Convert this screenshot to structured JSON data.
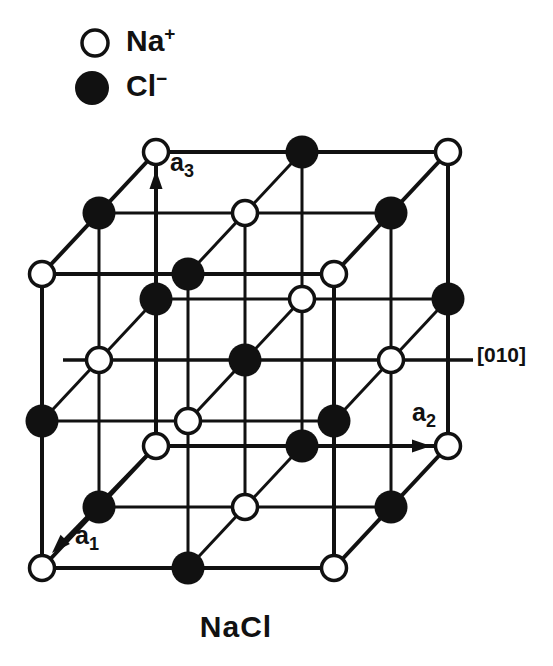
{
  "colors": {
    "ink": "#111111",
    "background": "#ffffff"
  },
  "legend": {
    "items": [
      {
        "ion": "Na+",
        "label": "Na",
        "charge": "+",
        "symbol": "open-circle"
      },
      {
        "ion": "Cl-",
        "label": "Cl",
        "charge": "−",
        "symbol": "filled-circle"
      }
    ]
  },
  "caption": {
    "text": "NaCl"
  },
  "figure": {
    "type": "crystal-structure",
    "structure": "rock-salt NaCl conventional cubic cell, 3×3×3 alternating ion sites",
    "projection": {
      "origin": [
        156,
        446
      ],
      "step_i": [
        146,
        0
      ],
      "step_j": [
        -57,
        61
      ],
      "step_k": [
        0,
        -147
      ],
      "steps": [
        0,
        1,
        2
      ]
    },
    "atom_styles": {
      "Na+": {
        "fill": "#ffffff",
        "stroke_width": 3.5,
        "radius": 12.5
      },
      "Cl-": {
        "fill": "#111111",
        "stroke_width": 0,
        "radius": 16.5
      }
    },
    "legend_symbols": [
      {
        "ion": "Na+",
        "center": [
          95,
          43
        ],
        "radius": 13
      },
      {
        "ion": "Cl-",
        "center": [
          92,
          88
        ],
        "radius": 17
      }
    ],
    "wireframe": {
      "edge_width": 4,
      "inner_width": 3
    },
    "axes": [
      {
        "id": "a1",
        "label": "a",
        "sub": "1",
        "shaft_from": [
          156,
          446
        ],
        "tip": [
          52,
          553
        ]
      },
      {
        "id": "a2",
        "label": "a",
        "sub": "2",
        "shaft_from": [
          156,
          446
        ],
        "tip": [
          431,
          446
        ]
      },
      {
        "id": "a3",
        "label": "a",
        "sub": "3",
        "shaft_from": [
          156,
          446
        ],
        "tip": [
          156,
          170
        ]
      }
    ],
    "direction_label": {
      "text": "[010]",
      "line_from": [
        63,
        360
      ],
      "line_to": [
        473,
        360
      ],
      "line_width": 3.5
    },
    "atoms": [
      {
        "pos": [
          0,
          0,
          0
        ],
        "ion": "Na+"
      },
      {
        "pos": [
          1,
          0,
          0
        ],
        "ion": "Cl-"
      },
      {
        "pos": [
          2,
          0,
          0
        ],
        "ion": "Na+"
      },
      {
        "pos": [
          0,
          1,
          0
        ],
        "ion": "Cl-"
      },
      {
        "pos": [
          1,
          1,
          0
        ],
        "ion": "Na+"
      },
      {
        "pos": [
          2,
          1,
          0
        ],
        "ion": "Cl-"
      },
      {
        "pos": [
          0,
          2,
          0
        ],
        "ion": "Na+"
      },
      {
        "pos": [
          1,
          2,
          0
        ],
        "ion": "Cl-"
      },
      {
        "pos": [
          2,
          2,
          0
        ],
        "ion": "Na+"
      },
      {
        "pos": [
          0,
          0,
          1
        ],
        "ion": "Cl-"
      },
      {
        "pos": [
          1,
          0,
          1
        ],
        "ion": "Na+"
      },
      {
        "pos": [
          2,
          0,
          1
        ],
        "ion": "Cl-"
      },
      {
        "pos": [
          0,
          1,
          1
        ],
        "ion": "Na+"
      },
      {
        "pos": [
          1,
          1,
          1
        ],
        "ion": "Cl-"
      },
      {
        "pos": [
          2,
          1,
          1
        ],
        "ion": "Na+"
      },
      {
        "pos": [
          0,
          2,
          1
        ],
        "ion": "Cl-"
      },
      {
        "pos": [
          1,
          2,
          1
        ],
        "ion": "Na+"
      },
      {
        "pos": [
          2,
          2,
          1
        ],
        "ion": "Cl-"
      },
      {
        "pos": [
          0,
          0,
          2
        ],
        "ion": "Na+"
      },
      {
        "pos": [
          1,
          0,
          2
        ],
        "ion": "Cl-"
      },
      {
        "pos": [
          2,
          0,
          2
        ],
        "ion": "Na+"
      },
      {
        "pos": [
          0,
          1,
          2
        ],
        "ion": "Cl-"
      },
      {
        "pos": [
          1,
          1,
          2
        ],
        "ion": "Na+"
      },
      {
        "pos": [
          2,
          1,
          2
        ],
        "ion": "Cl-"
      },
      {
        "pos": [
          0,
          2,
          2
        ],
        "ion": "Na+"
      },
      {
        "pos": [
          1,
          2,
          2
        ],
        "ion": "Cl-"
      },
      {
        "pos": [
          2,
          2,
          2
        ],
        "ion": "Na+"
      }
    ]
  }
}
